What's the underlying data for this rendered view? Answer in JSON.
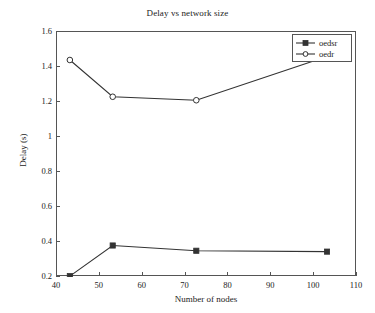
{
  "chart_data": {
    "type": "line",
    "title": "Delay vs network size",
    "xlabel": "Number of nodes",
    "ylabel": "Delay (s)",
    "xlim": [
      40,
      110
    ],
    "ylim": [
      0.2,
      1.6
    ],
    "xticks": [
      40,
      50,
      60,
      70,
      80,
      90,
      100,
      110
    ],
    "xtick_labels": [
      "40",
      "50",
      "60",
      "70",
      "80",
      "90",
      "100",
      "110"
    ],
    "yticks": [
      0.2,
      0.4,
      0.6,
      0.8,
      1.0,
      1.2,
      1.4,
      1.6
    ],
    "ytick_labels": [
      "0.2",
      "0.4",
      "0.6",
      "0.8",
      "1",
      "1.2",
      "1.4",
      "1.6"
    ],
    "grid": false,
    "legend_position": "top-right",
    "x": [
      43,
      53,
      72.5,
      103
    ],
    "series": [
      {
        "name": "oedsr",
        "marker": "filled-square",
        "color": "#333333",
        "values": [
          0.205,
          0.38,
          0.35,
          0.345
        ]
      },
      {
        "name": "oedr",
        "marker": "open-circle",
        "color": "#333333",
        "values": [
          1.44,
          1.23,
          1.21,
          1.46
        ]
      }
    ]
  },
  "legend": {
    "items": [
      {
        "label": "oedsr"
      },
      {
        "label": "oedr"
      }
    ]
  }
}
